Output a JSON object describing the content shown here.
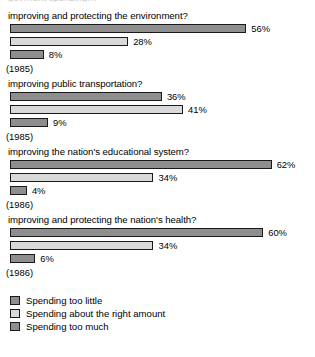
{
  "clipped_header_text": "gov…ent spending…",
  "legend": {
    "items": [
      {
        "label": "Spending too little",
        "color": "#8e8e8e",
        "swatch_name": "legend-swatch-too-little"
      },
      {
        "label": "Spending about the right amount",
        "color": "#d9d9d9",
        "swatch_name": "legend-swatch-right-amount"
      },
      {
        "label": "Spending too much",
        "color": "#8e8e8e",
        "swatch_name": "legend-swatch-too-much"
      }
    ]
  },
  "chart_data": {
    "type": "bar",
    "orientation": "horizontal",
    "title": "",
    "xlabel": "",
    "ylabel": "",
    "xlim": [
      0,
      62
    ],
    "grid": false,
    "legend_position": "bottom-left",
    "px_per_percent": 4.22,
    "bar_origin_px": 10,
    "categories": [
      "improving and protecting the environment?",
      "improving public transportation?",
      "improving the nation's educational system?",
      "improving and protecting the nation's health?"
    ],
    "category_years": [
      "(1985)",
      "(1985)",
      "(1986)",
      "(1986)"
    ],
    "series": [
      {
        "name": "Spending too little",
        "values": [
          56,
          36,
          62,
          60
        ],
        "labels": [
          "56%",
          "36%",
          "62%",
          "60%"
        ]
      },
      {
        "name": "Spending about the right amount",
        "values": [
          28,
          41,
          34,
          34
        ],
        "labels": [
          "28%",
          "41%",
          "34%",
          "34%"
        ]
      },
      {
        "name": "Spending too much",
        "values": [
          8,
          9,
          4,
          6
        ],
        "labels": [
          "8%",
          "9%",
          "4%",
          "6%"
        ]
      }
    ],
    "groups": [
      {
        "question": "improving and protecting the environment?",
        "year": "(1985)",
        "bars": [
          {
            "series": "Spending too little",
            "value": 56,
            "label": "56%"
          },
          {
            "series": "Spending about the right amount",
            "value": 28,
            "label": "28%"
          },
          {
            "series": "Spending too much",
            "value": 8,
            "label": "8%"
          }
        ]
      },
      {
        "question": "improving public transportation?",
        "year": "(1985)",
        "bars": [
          {
            "series": "Spending too little",
            "value": 36,
            "label": "36%"
          },
          {
            "series": "Spending about the right amount",
            "value": 41,
            "label": "41%"
          },
          {
            "series": "Spending too much",
            "value": 9,
            "label": "9%"
          }
        ]
      },
      {
        "question": "improving the nation's educational system?",
        "year": "(1986)",
        "bars": [
          {
            "series": "Spending too little",
            "value": 62,
            "label": "62%"
          },
          {
            "series": "Spending about the right amount",
            "value": 34,
            "label": "34%"
          },
          {
            "series": "Spending too much",
            "value": 4,
            "label": "4%"
          }
        ]
      },
      {
        "question": "improving and protecting the nation's health?",
        "year": "(1986)",
        "bars": [
          {
            "series": "Spending too little",
            "value": 60,
            "label": "60%"
          },
          {
            "series": "Spending about the right amount",
            "value": 34,
            "label": "34%"
          },
          {
            "series": "Spending too much",
            "value": 6,
            "label": "6%"
          }
        ]
      }
    ]
  }
}
